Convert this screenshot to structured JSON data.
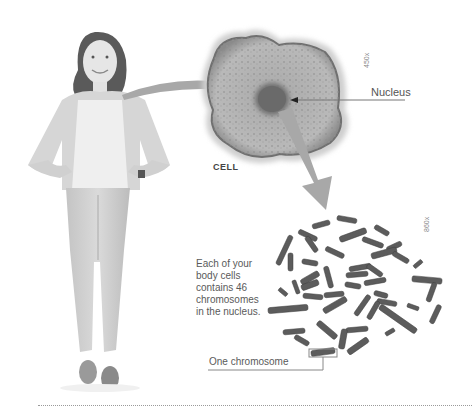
{
  "figure": {
    "labels": {
      "nucleus": "Nucleus",
      "cell": "CELL",
      "cell_magnification": "450x",
      "chromosome_magnification": "860x",
      "one_chromosome": "One chromosome"
    },
    "caption_lines": [
      "Each of your",
      "body cells",
      "contains 46",
      "chromosomes",
      "in the nucleus."
    ],
    "colors": {
      "arrow": "#a8a8a8",
      "cell_fill": "#b8b8b8",
      "cell_edge": "#707070",
      "nucleus": "#6a6a6a",
      "chromosome": "#5a5a5a",
      "line": "#9a9a9a"
    }
  }
}
